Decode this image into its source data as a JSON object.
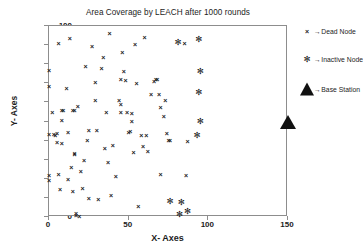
{
  "chart_data": {
    "type": "scatter",
    "title": "Area Coverage by LEACH after 1000 rounds",
    "xlabel": "X- Axes",
    "ylabel": "Y- Axes",
    "xlim": [
      0,
      150
    ],
    "ylim": [
      0,
      100
    ],
    "xticks": [
      0,
      50,
      100,
      150
    ],
    "yticks": [
      0,
      10,
      20,
      30,
      40,
      50,
      60,
      70,
      80,
      90,
      100
    ],
    "grid": false,
    "legend_position": "right-outside",
    "series": [
      {
        "name": "Dead Node",
        "marker": "x",
        "color": "#1a1a1a",
        "points": [
          [
            0,
            77
          ],
          [
            0,
            68.5
          ],
          [
            0,
            43.5
          ],
          [
            0,
            22
          ],
          [
            0,
            19.5
          ],
          [
            2,
            55
          ],
          [
            3,
            43.5
          ],
          [
            4,
            43
          ],
          [
            5,
            44
          ],
          [
            5,
            39.5
          ],
          [
            6,
            91
          ],
          [
            6,
            22.5
          ],
          [
            7,
            14.8
          ],
          [
            8,
            55.8
          ],
          [
            8,
            51
          ],
          [
            8,
            39
          ],
          [
            9,
            56
          ],
          [
            11,
            67.5
          ],
          [
            12,
            44.5
          ],
          [
            12,
            20
          ],
          [
            13,
            93.5
          ],
          [
            14,
            26
          ],
          [
            15,
            13.5
          ],
          [
            15,
            56
          ],
          [
            16,
            55.8
          ],
          [
            16,
            32.8
          ],
          [
            16,
            33.5
          ],
          [
            17,
            1
          ],
          [
            17,
            2
          ],
          [
            18,
            58
          ],
          [
            19,
            0.5
          ],
          [
            20,
            24
          ],
          [
            21,
            15
          ],
          [
            22,
            29.8
          ],
          [
            23,
            79
          ],
          [
            24,
            40.5
          ],
          [
            25,
            45.5
          ],
          [
            25,
            10
          ],
          [
            27,
            89.5
          ],
          [
            29,
            70.5
          ],
          [
            29,
            61
          ],
          [
            30,
            45.5
          ],
          [
            31,
            9.3
          ],
          [
            33,
            78
          ],
          [
            34,
            84
          ],
          [
            35,
            36
          ],
          [
            36,
            54.8
          ],
          [
            37,
            28.8
          ],
          [
            38,
            96.5
          ],
          [
            39,
            11.7
          ],
          [
            40,
            37.5
          ],
          [
            42,
            21.5
          ],
          [
            44,
            61.5
          ],
          [
            45,
            59
          ],
          [
            45,
            72
          ],
          [
            45,
            55
          ],
          [
            46,
            86.5
          ],
          [
            47,
            76.5
          ],
          [
            48,
            71.5
          ],
          [
            49,
            55
          ],
          [
            50,
            44.5
          ],
          [
            51,
            45
          ],
          [
            52,
            54.2
          ],
          [
            52,
            50.5
          ],
          [
            53,
            33.8
          ],
          [
            54,
            90.5
          ],
          [
            55,
            70
          ],
          [
            56,
            5.5
          ],
          [
            58,
            43
          ],
          [
            59,
            37
          ],
          [
            60,
            94.5
          ],
          [
            61,
            43
          ],
          [
            62,
            34.8
          ],
          [
            64,
            64.5
          ],
          [
            66,
            71
          ],
          [
            67,
            72
          ],
          [
            68,
            72.5
          ],
          [
            69,
            64.5
          ],
          [
            70,
            22.5
          ],
          [
            70,
            57.5
          ],
          [
            72,
            53
          ],
          [
            73,
            61.5
          ],
          [
            74,
            44
          ],
          [
            75,
            40.5
          ],
          [
            76,
            40.3
          ],
          [
            85,
            91
          ],
          [
            86,
            22
          ],
          [
            87,
            40
          ]
        ]
      },
      {
        "name": "Inactive Node",
        "marker": "*",
        "color": "#1a1a1a",
        "points": [
          [
            81,
            91.5
          ],
          [
            94,
            93
          ],
          [
            95,
            76.5
          ],
          [
            94,
            65.5
          ],
          [
            95,
            50.5
          ],
          [
            93,
            43
          ],
          [
            76,
            8.5
          ],
          [
            83,
            8
          ],
          [
            82,
            1.5
          ],
          [
            87,
            3
          ]
        ]
      },
      {
        "name": "Base Station",
        "marker": "triangle",
        "color": "#111111",
        "points": [
          [
            150,
            50
          ]
        ]
      }
    ]
  },
  "legend": {
    "arrow": "→",
    "items": [
      {
        "label": "Dead Node",
        "glyph": "×",
        "type": "dead"
      },
      {
        "label": "Inactive Node",
        "glyph": "✻",
        "type": "inactive"
      },
      {
        "label": "Base Station",
        "glyph": "",
        "type": "triangle"
      }
    ]
  }
}
